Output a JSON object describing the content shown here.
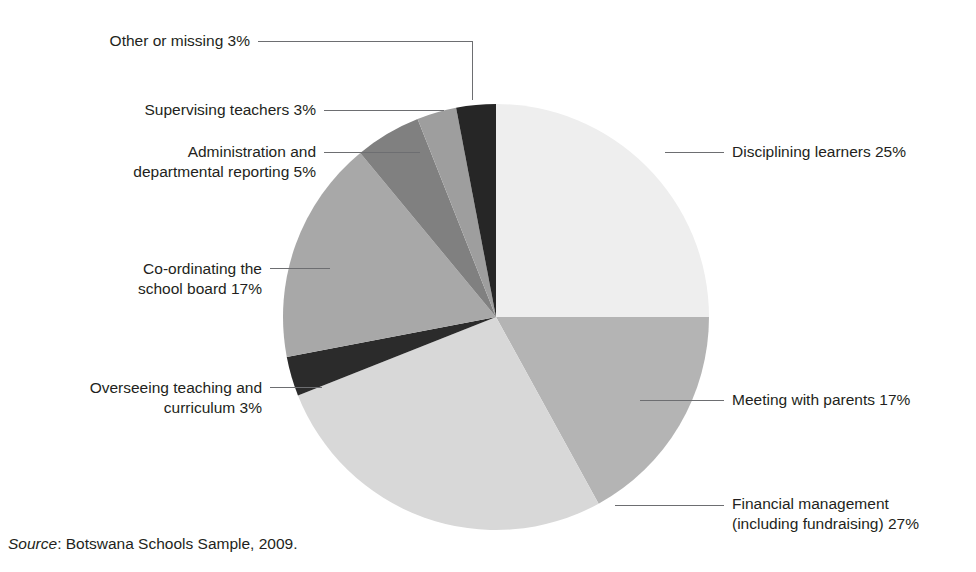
{
  "figure": {
    "clipped_title": "………………………………………………",
    "source_label": "Source",
    "source_rest": ": Botswana Schools Sample, 2009.",
    "background": "#ffffff",
    "text_color": "#231f20",
    "leader_color": "#6d6e71"
  },
  "chart_data": {
    "type": "pie",
    "title": "",
    "xlabel": "",
    "ylabel": "",
    "legend_position": "callout-labels",
    "grid": false,
    "units": "percent",
    "start_angle_deg": 0,
    "direction": "clockwise",
    "center": {
      "x": 496,
      "y": 317
    },
    "radius": 213,
    "total": 100,
    "categories": [
      "Disciplining learners",
      "Meeting with parents",
      "Financial management (including fundraising)",
      "Overseeing teaching and curriculum",
      "Co-ordinating the school board",
      "Administration and departmental reporting",
      "Supervising teachers",
      "Other or missing"
    ],
    "values": [
      25,
      17,
      27,
      3,
      17,
      5,
      3,
      3
    ],
    "colors": [
      "#eeeeee",
      "#b4b4b4",
      "#d8d8d8",
      "#2b2b2b",
      "#a8a8a8",
      "#808080",
      "#9e9e9e",
      "#262626"
    ],
    "slices": [
      {
        "name": "Disciplining learners",
        "value": 25,
        "color": "#eeeeee",
        "label_line1": "Disciplining learners 25%",
        "label_line2": "",
        "label_side": "right",
        "label_x": 732,
        "label_y": 142
      },
      {
        "name": "Meeting with parents",
        "value": 17,
        "color": "#b4b4b4",
        "label_line1": "Meeting with parents 17%",
        "label_line2": "",
        "label_side": "right",
        "label_x": 732,
        "label_y": 390
      },
      {
        "name": "Financial management (including fundraising)",
        "value": 27,
        "color": "#d8d8d8",
        "label_line1": "Financial management",
        "label_line2": "(including fundraising) 27%",
        "label_side": "right",
        "label_x": 732,
        "label_y": 494
      },
      {
        "name": "Overseeing teaching and curriculum",
        "value": 3,
        "color": "#2b2b2b",
        "label_line1": "Overseeing teaching and",
        "label_line2": "curriculum 3%",
        "label_side": "left",
        "label_x": 262,
        "label_y": 378
      },
      {
        "name": "Co-ordinating the school board",
        "value": 17,
        "color": "#a8a8a8",
        "label_line1": "Co-ordinating the",
        "label_line2": "school board 17%",
        "label_side": "left",
        "label_x": 262,
        "label_y": 259
      },
      {
        "name": "Administration and departmental reporting",
        "value": 5,
        "color": "#808080",
        "label_line1": "Administration and",
        "label_line2": "departmental reporting 5%",
        "label_side": "left",
        "label_x": 316,
        "label_y": 142
      },
      {
        "name": "Supervising teachers",
        "value": 3,
        "color": "#9e9e9e",
        "label_line1": "Supervising teachers 3%",
        "label_line2": "",
        "label_side": "left",
        "label_x": 316,
        "label_y": 102
      },
      {
        "name": "Other or missing",
        "value": 3,
        "color": "#262626",
        "label_line1": "Other or missing 3%",
        "label_line2": "",
        "label_side": "left",
        "label_x": 250,
        "label_y": 27
      }
    ]
  }
}
